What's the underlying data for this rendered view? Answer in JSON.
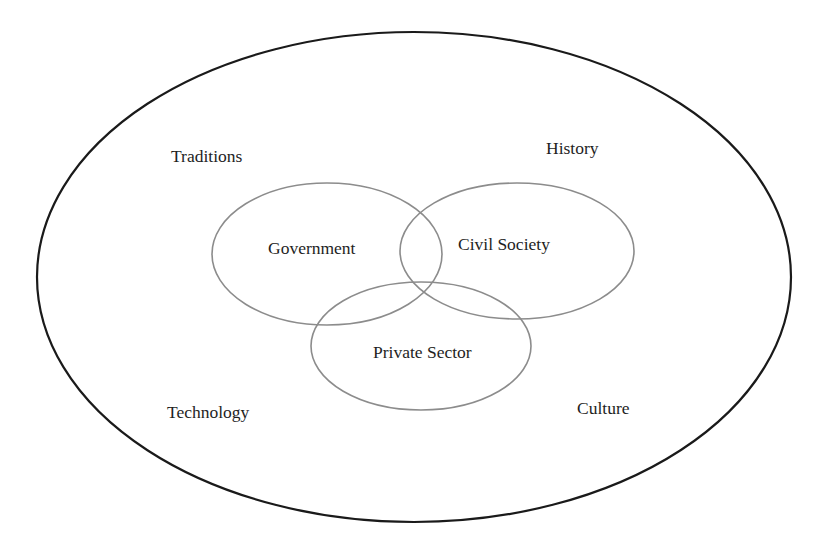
{
  "diagram": {
    "type": "nested-venn",
    "colors": {
      "background": "#ffffff",
      "outer_stroke": "#1a1a1a",
      "sector_stroke": "#8c8c8c",
      "text": "#1e1e1e"
    },
    "outer_context": {
      "shape": "ellipse",
      "cx": 414,
      "cy": 277,
      "rx": 377,
      "ry": 245,
      "labels": [
        {
          "text": "Traditions",
          "x": 171,
          "y": 162
        },
        {
          "text": "History",
          "x": 546,
          "y": 154
        },
        {
          "text": "Technology",
          "x": 167,
          "y": 418
        },
        {
          "text": "Culture",
          "x": 577,
          "y": 414
        }
      ]
    },
    "sectors": [
      {
        "text": "Government",
        "cx": 327,
        "cy": 254,
        "rx": 115,
        "ry": 71,
        "label_x": 268,
        "label_y": 254
      },
      {
        "text": "Civil Society",
        "cx": 517,
        "cy": 251,
        "rx": 117,
        "ry": 68,
        "label_x": 458,
        "label_y": 250
      },
      {
        "text": "Private Sector",
        "cx": 421,
        "cy": 346,
        "rx": 110,
        "ry": 64,
        "label_x": 373,
        "label_y": 358
      }
    ]
  }
}
